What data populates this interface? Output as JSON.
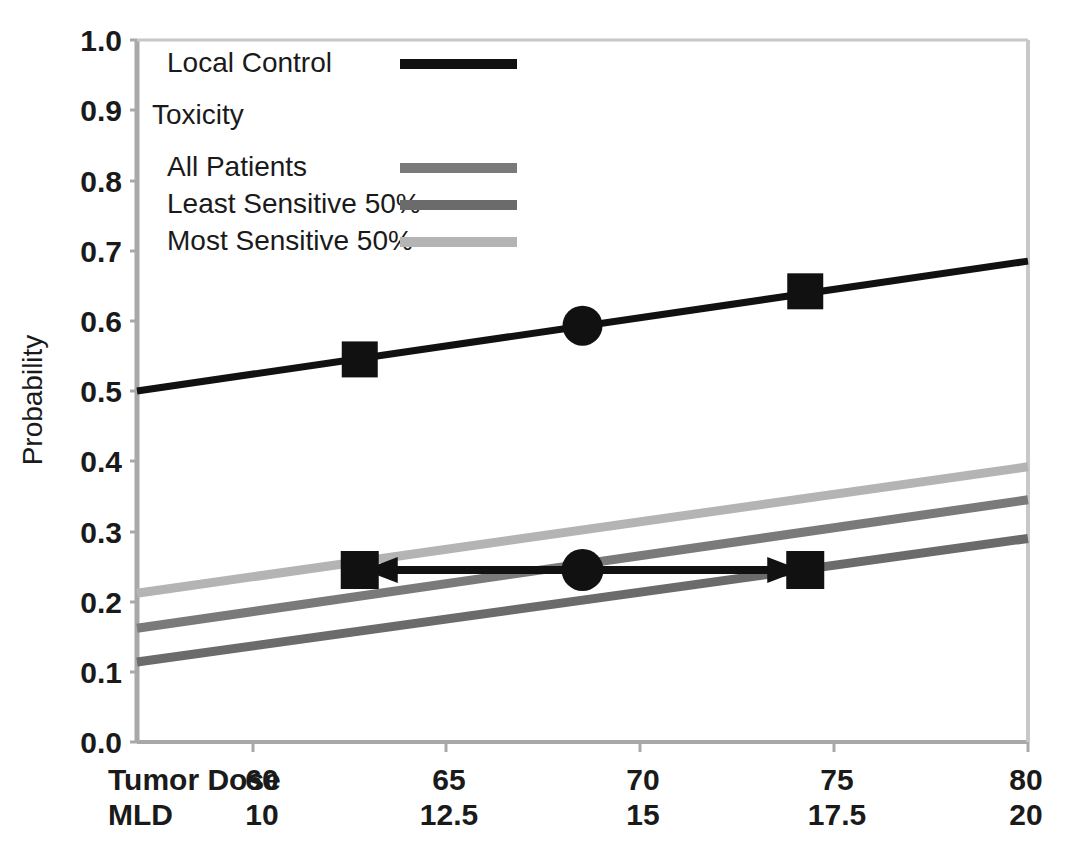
{
  "chart_data": {
    "type": "line",
    "title": "",
    "subtitle": "",
    "ylabel": "Probability",
    "xlabel": "",
    "ylim": [
      0.0,
      1.0
    ],
    "ytick_labels": [
      "0.0",
      "0.1",
      "0.2",
      "0.3",
      "0.4",
      "0.5",
      "0.6",
      "0.7",
      "0.8",
      "0.9",
      "1.0"
    ],
    "ytick_values": [
      0.0,
      0.1,
      0.2,
      0.3,
      0.4,
      0.5,
      0.6,
      0.7,
      0.8,
      0.9,
      1.0
    ],
    "grid": false,
    "legend_position": "top-left-inside",
    "x_axes": [
      {
        "name": "Tumor Dose",
        "tick_labels": [
          "60",
          "65",
          "70",
          "75",
          "80"
        ],
        "tick_values": [
          60,
          65,
          70,
          75,
          80
        ],
        "xlim": [
          60,
          80
        ]
      },
      {
        "name": "MLD",
        "tick_labels": [
          "10",
          "12.5",
          "15",
          "17.5",
          "20"
        ],
        "tick_values": [
          10,
          12.5,
          15,
          17.5,
          20
        ],
        "xlim": [
          10,
          20
        ]
      }
    ],
    "series": [
      {
        "name": "Local Control",
        "color": "#111111",
        "x": [
          60,
          80
        ],
        "values": [
          0.5,
          0.685
        ],
        "markers": [
          {
            "x": 65,
            "y": 0.545,
            "shape": "square"
          },
          {
            "x": 70,
            "y": 0.593,
            "shape": "circle"
          },
          {
            "x": 75,
            "y": 0.642,
            "shape": "square"
          }
        ]
      },
      {
        "name": "All Patients",
        "color": "#7a7a7a",
        "x": [
          60,
          80
        ],
        "values": [
          0.162,
          0.345
        ],
        "markers": []
      },
      {
        "name": "Least Sensitive 50%",
        "color": "#6b6b6b",
        "x": [
          60,
          80
        ],
        "values": [
          0.114,
          0.29
        ],
        "markers": []
      },
      {
        "name": "Most Sensitive 50%",
        "color": "#b4b4b4",
        "x": [
          60,
          80
        ],
        "values": [
          0.212,
          0.392
        ],
        "markers": []
      }
    ],
    "annotations": [
      {
        "name": "toxicity-iso-arrow",
        "type": "double-headed-arrow",
        "y": 0.245,
        "x_from": 65,
        "x_to": 75,
        "color": "#111111",
        "markers": [
          {
            "x": 65,
            "y": 0.245,
            "shape": "square"
          },
          {
            "x": 70,
            "y": 0.245,
            "shape": "circle"
          },
          {
            "x": 75,
            "y": 0.245,
            "shape": "square"
          }
        ]
      }
    ]
  },
  "legend": {
    "entries": [
      {
        "label": "Local Control",
        "swatch": "#111111",
        "indent": 0,
        "has_swatch": true
      },
      {
        "label": "Toxicity",
        "swatch": "",
        "indent": 0,
        "has_swatch": false
      },
      {
        "label": "All Patients",
        "swatch": "#7a7a7a",
        "indent": 1,
        "has_swatch": true
      },
      {
        "label": "Least Sensitive 50%",
        "swatch": "#6b6b6b",
        "indent": 1,
        "has_swatch": true
      },
      {
        "label": "Most Sensitive 50%",
        "swatch": "#b4b4b4",
        "indent": 1,
        "has_swatch": true
      }
    ]
  },
  "axis_labels": {
    "y_title": "Probability",
    "x_row1_name": "Tumor Dose",
    "x_row2_name": "MLD",
    "y_ticks": [
      "1.0",
      "0.9",
      "0.8",
      "0.7",
      "0.6",
      "0.5",
      "0.4",
      "0.3",
      "0.2",
      "0.1",
      "0.0"
    ],
    "x_row1_ticks": [
      "60",
      "65",
      "70",
      "75",
      "80"
    ],
    "x_row2_ticks": [
      "10",
      "12.5",
      "15",
      "17.5",
      "20"
    ]
  },
  "colors": {
    "axis": "#a8a8a8",
    "text": "#1a1a1a",
    "local_control": "#111111",
    "all_patients": "#7a7a7a",
    "least_sensitive": "#6b6b6b",
    "most_sensitive": "#b4b4b4",
    "background": "#ffffff"
  }
}
